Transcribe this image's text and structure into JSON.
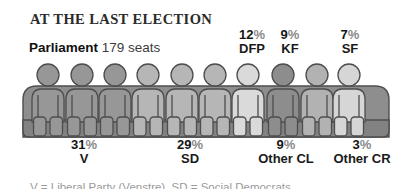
{
  "header": {
    "title": "AT THE LAST ELECTION",
    "subtitle_bold": "Parliament",
    "subtitle_rest": " 179 seats"
  },
  "percent_sign": "%",
  "footnote": "V = Liberal Party (Venstre), SD = Social Democrats",
  "labels": {
    "top": [
      {
        "value": "12",
        "name": "DFP"
      },
      {
        "value": "9",
        "name": "KF"
      },
      {
        "value": "7",
        "name": "SF"
      }
    ],
    "bottom": [
      {
        "value": "31",
        "name": "V"
      },
      {
        "value": "29",
        "name": "SD"
      },
      {
        "value": "9",
        "name": "Other CL"
      },
      {
        "value": "3",
        "name": "Other CR"
      }
    ]
  },
  "chart_data": {
    "type": "pictogram",
    "title": "AT THE LAST ELECTION",
    "subtitle": "Parliament 179 seats",
    "total_seats": 179,
    "parties": [
      {
        "name": "V",
        "percent": 31,
        "label_position": "below"
      },
      {
        "name": "SD",
        "percent": 29,
        "label_position": "below"
      },
      {
        "name": "DFP",
        "percent": 12,
        "label_position": "above"
      },
      {
        "name": "KF",
        "percent": 9,
        "label_position": "above"
      },
      {
        "name": "Other CL",
        "percent": 9,
        "label_position": "below"
      },
      {
        "name": "SF",
        "percent": 7,
        "label_position": "above"
      },
      {
        "name": "Other CR",
        "percent": 3,
        "label_position": "below"
      }
    ],
    "bench_color": "#8e8e8e",
    "bench_front_color": "#828282",
    "outline_color": "#4d4d4d",
    "seat_figures": [
      {
        "party": "V",
        "x": 48,
        "color": "#979797"
      },
      {
        "party": "V",
        "x": 82,
        "color": "#979797"
      },
      {
        "party": "V",
        "x": 115,
        "color": "#979797"
      },
      {
        "party": "SD",
        "x": 148,
        "color": "#b6b6b6"
      },
      {
        "party": "SD",
        "x": 182,
        "color": "#b6b6b6"
      },
      {
        "party": "SD",
        "x": 215,
        "color": "#b6b6b6"
      },
      {
        "party": "DFP",
        "x": 248,
        "color": "#dadada"
      },
      {
        "party": "KF",
        "x": 283,
        "color": "#8d8d8d"
      },
      {
        "party": "Other CL",
        "x": 317,
        "color": "#b2b2b2"
      },
      {
        "party": "SF",
        "x": 349,
        "color": "#d6d6d6"
      }
    ]
  }
}
